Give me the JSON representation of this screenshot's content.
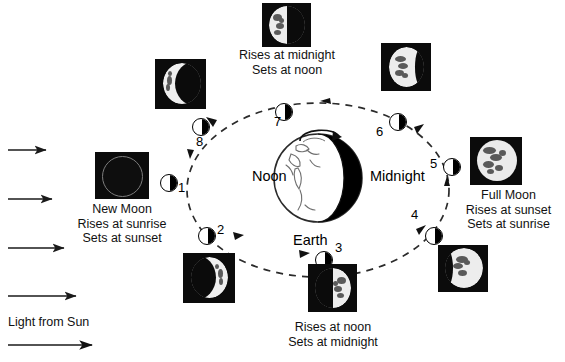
{
  "diagram": {
    "earth_label": "Earth",
    "noon_label": "Noon",
    "midnight_label": "Midnight",
    "sun_label": "Light from Sun",
    "orbit_direction": "counterclockwise",
    "sunlight_arrow_count": 5
  },
  "colors": {
    "ink": "#000000",
    "background": "#ffffff",
    "photo_background": "#0b0b0b",
    "moon_lit": "#f2f2f2",
    "orbit_dash": "#333333"
  },
  "positions": [
    {
      "number": "1",
      "phase": "new-moon"
    },
    {
      "number": "2",
      "phase": "waxing-crescent"
    },
    {
      "number": "3",
      "phase": "first-quarter"
    },
    {
      "number": "4",
      "phase": "waxing-gibbous"
    },
    {
      "number": "5",
      "phase": "full-moon"
    },
    {
      "number": "6",
      "phase": "waning-gibbous"
    },
    {
      "number": "7",
      "phase": "last-quarter"
    },
    {
      "number": "8",
      "phase": "waning-crescent"
    }
  ],
  "captions": {
    "new_moon": {
      "name": "New Moon",
      "rises": "Rises at sunrise",
      "sets": "Sets at sunset"
    },
    "full_moon": {
      "name": "Full Moon",
      "rises": "Rises at sunset",
      "sets": "Sets at sunrise"
    },
    "last_quarter": {
      "rises": "Rises at midnight",
      "sets": "Sets at noon"
    },
    "first_quarter": {
      "rises": "Rises at noon",
      "sets": "Sets at midnight"
    }
  },
  "photos": [
    {
      "id": "photo-new-moon",
      "phase": "new-moon",
      "label": "New Moon photograph"
    },
    {
      "id": "photo-waxing-crescent",
      "phase": "waxing-crescent",
      "label": "Waxing crescent photograph"
    },
    {
      "id": "photo-first-quarter",
      "phase": "first-quarter",
      "label": "First quarter photograph"
    },
    {
      "id": "photo-waxing-gibbous",
      "phase": "waxing-gibbous",
      "label": "Waxing gibbous photograph"
    },
    {
      "id": "photo-full-moon",
      "phase": "full-moon",
      "label": "Full Moon photograph"
    },
    {
      "id": "photo-waning-gibbous",
      "phase": "waning-gibbous",
      "label": "Waning gibbous photograph"
    },
    {
      "id": "photo-last-quarter",
      "phase": "last-quarter",
      "label": "Last quarter photograph"
    },
    {
      "id": "photo-waning-crescent",
      "phase": "waning-crescent",
      "label": "Waning crescent photograph"
    }
  ]
}
